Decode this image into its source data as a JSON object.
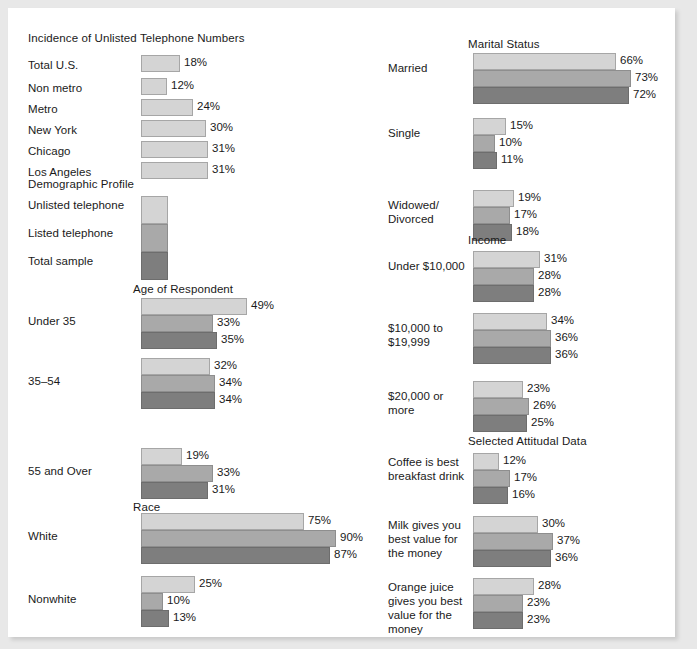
{
  "palette": {
    "series0": "#d4d4d4",
    "series1": "#a9a9a9",
    "series2": "#7e7e7e",
    "page_bg": "#ffffff",
    "outer_bg": "#e8e8e8",
    "text": "#1a1a1a"
  },
  "headings": {
    "incidence": "Incidence of Unlisted Telephone Numbers",
    "demographic": "Demographic Profile",
    "age": "Age of Respondent",
    "race": "Race",
    "marital": "Marital Status",
    "income": "Income",
    "attitudal": "Selected Attitudal Data"
  },
  "legend": [
    {
      "label": "Unlisted telephone",
      "color": "#d4d4d4"
    },
    {
      "label": "Listed telephone",
      "color": "#a9a9a9"
    },
    {
      "label": "Total sample",
      "color": "#7e7e7e"
    }
  ],
  "incidence": [
    {
      "label": "Total U.S.",
      "value": 18,
      "value_label": "18%"
    },
    {
      "label": "Non metro",
      "value": 12,
      "value_label": "12%"
    },
    {
      "label": "Metro",
      "value": 24,
      "value_label": "24%"
    },
    {
      "label": "New York",
      "value": 30,
      "value_label": "30%"
    },
    {
      "label": "Chicago",
      "value": 31,
      "value_label": "31%"
    },
    {
      "label": "Los Angeles",
      "value": 31,
      "value_label": "31%"
    }
  ],
  "age": [
    {
      "label": "Under 35",
      "values": [
        49,
        33,
        35
      ],
      "value_labels": [
        "49%",
        "33%",
        "35%"
      ]
    },
    {
      "label": "35–54",
      "values": [
        32,
        34,
        34
      ],
      "value_labels": [
        "32%",
        "34%",
        "34%"
      ]
    },
    {
      "label": "55 and Over",
      "values": [
        19,
        33,
        31
      ],
      "value_labels": [
        "19%",
        "33%",
        "31%"
      ]
    }
  ],
  "race": [
    {
      "label": "White",
      "values": [
        75,
        90,
        87
      ],
      "value_labels": [
        "75%",
        "90%",
        "87%"
      ]
    },
    {
      "label": "Nonwhite",
      "values": [
        25,
        10,
        13
      ],
      "value_labels": [
        "25%",
        "10%",
        "13%"
      ]
    }
  ],
  "marital": [
    {
      "label": "Married",
      "values": [
        66,
        73,
        72
      ],
      "value_labels": [
        "66%",
        "73%",
        "72%"
      ]
    },
    {
      "label": "Single",
      "values": [
        15,
        10,
        11
      ],
      "value_labels": [
        "15%",
        "10%",
        "11%"
      ]
    },
    {
      "label": "Widowed/\nDivorced",
      "values": [
        19,
        17,
        18
      ],
      "value_labels": [
        "19%",
        "17%",
        "18%"
      ]
    }
  ],
  "income": [
    {
      "label": "Under $10,000",
      "values": [
        31,
        28,
        28
      ],
      "value_labels": [
        "31%",
        "28%",
        "28%"
      ]
    },
    {
      "label": "$10,000 to\n$19,999",
      "values": [
        34,
        36,
        36
      ],
      "value_labels": [
        "34%",
        "36%",
        "36%"
      ]
    },
    {
      "label": "$20,000 or\nmore",
      "values": [
        23,
        26,
        25
      ],
      "value_labels": [
        "23%",
        "26%",
        "25%"
      ]
    }
  ],
  "attitudal": [
    {
      "label": "Coffee is best\nbreakfast drink",
      "values": [
        12,
        17,
        16
      ],
      "value_labels": [
        "12%",
        "17%",
        "16%"
      ]
    },
    {
      "label": "Milk gives you\nbest value for\nthe money",
      "values": [
        30,
        37,
        36
      ],
      "value_labels": [
        "30%",
        "37%",
        "36%"
      ]
    },
    {
      "label": "Orange juice\ngives you best\nvalue for the\nmoney",
      "values": [
        28,
        23,
        23
      ],
      "value_labels": [
        "28%",
        "23%",
        "23%"
      ]
    }
  ],
  "chart_data": {
    "type": "bar",
    "title": "Incidence of Unlisted Telephone Numbers",
    "orientation": "horizontal",
    "xlabel": "",
    "ylabel": "",
    "xlim": [
      0,
      100
    ],
    "grid": false,
    "legend_position": "inline-swatch-column",
    "units": "percent",
    "series": [
      {
        "name": "Unlisted telephone",
        "color": "#d4d4d4"
      },
      {
        "name": "Listed telephone",
        "color": "#a9a9a9"
      },
      {
        "name": "Total sample",
        "color": "#7e7e7e"
      }
    ],
    "panels": [
      {
        "title": "Incidence of Unlisted Telephone Numbers",
        "single_series": true,
        "series_name": "Unlisted telephone",
        "categories": [
          "Total U.S.",
          "Non metro",
          "Metro",
          "New York",
          "Chicago",
          "Los Angeles"
        ],
        "values": [
          18,
          12,
          24,
          30,
          31,
          31
        ]
      },
      {
        "title": "Age of Respondent",
        "categories": [
          "Under 35",
          "35–54",
          "55 and Over"
        ],
        "series": [
          {
            "name": "Unlisted telephone",
            "values": [
              49,
              32,
              19
            ]
          },
          {
            "name": "Listed telephone",
            "values": [
              33,
              34,
              33
            ]
          },
          {
            "name": "Total sample",
            "values": [
              35,
              34,
              31
            ]
          }
        ]
      },
      {
        "title": "Race",
        "categories": [
          "White",
          "Nonwhite"
        ],
        "series": [
          {
            "name": "Unlisted telephone",
            "values": [
              75,
              25
            ]
          },
          {
            "name": "Listed telephone",
            "values": [
              90,
              10
            ]
          },
          {
            "name": "Total sample",
            "values": [
              87,
              13
            ]
          }
        ]
      },
      {
        "title": "Marital Status",
        "categories": [
          "Married",
          "Single",
          "Widowed/Divorced"
        ],
        "series": [
          {
            "name": "Unlisted telephone",
            "values": [
              66,
              15,
              19
            ]
          },
          {
            "name": "Listed telephone",
            "values": [
              73,
              10,
              17
            ]
          },
          {
            "name": "Total sample",
            "values": [
              72,
              11,
              18
            ]
          }
        ]
      },
      {
        "title": "Income",
        "categories": [
          "Under $10,000",
          "$10,000 to $19,999",
          "$20,000 or more"
        ],
        "series": [
          {
            "name": "Unlisted telephone",
            "values": [
              31,
              34,
              23
            ]
          },
          {
            "name": "Listed telephone",
            "values": [
              28,
              36,
              26
            ]
          },
          {
            "name": "Total sample",
            "values": [
              28,
              36,
              25
            ]
          }
        ]
      },
      {
        "title": "Selected Attitudal Data",
        "categories": [
          "Coffee is best breakfast drink",
          "Milk gives you best value for the money",
          "Orange juice gives you best value for the money"
        ],
        "series": [
          {
            "name": "Unlisted telephone",
            "values": [
              12,
              30,
              28
            ]
          },
          {
            "name": "Listed telephone",
            "values": [
              17,
              37,
              23
            ]
          },
          {
            "name": "Total sample",
            "values": [
              16,
              36,
              23
            ]
          }
        ]
      }
    ]
  }
}
